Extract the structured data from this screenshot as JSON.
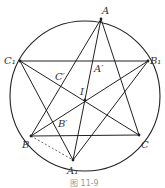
{
  "figure": {
    "caption": "图 11-9",
    "circle": {
      "cx": 85,
      "cy": 96,
      "r": 75
    },
    "points": {
      "A": {
        "label": "A",
        "x": 101,
        "y": 19,
        "lx": 102,
        "ly": 14
      },
      "B1": {
        "label": "B₁",
        "x": 148,
        "y": 61,
        "lx": 150,
        "ly": 64
      },
      "C1": {
        "label": "C₁",
        "x": 20,
        "y": 61,
        "lx": 4,
        "ly": 64
      },
      "B": {
        "label": "B",
        "x": 31,
        "y": 136,
        "lx": 22,
        "ly": 148
      },
      "C": {
        "label": "C",
        "x": 139,
        "y": 135,
        "lx": 141,
        "ly": 148
      },
      "A1": {
        "label": "A₁",
        "x": 73,
        "y": 160,
        "lx": 67,
        "ly": 174
      },
      "I": {
        "label": "I",
        "x": 85,
        "y": 100,
        "lx": 80,
        "ly": 95
      },
      "Ap": {
        "label": "A′",
        "x": 93,
        "y": 61,
        "lx": 94,
        "ly": 72
      },
      "Cp": {
        "label": "C′",
        "x": 66,
        "y": 75,
        "lx": 55,
        "ly": 80
      },
      "Bp": {
        "label": "B′",
        "x": 60,
        "y": 120,
        "lx": 58,
        "ly": 127
      }
    },
    "segments": [
      [
        "A",
        "B"
      ],
      [
        "A",
        "C"
      ],
      [
        "A",
        "A1"
      ],
      [
        "B",
        "C"
      ],
      [
        "C1",
        "B1"
      ],
      [
        "C1",
        "C"
      ],
      [
        "B1",
        "B"
      ],
      [
        "C1",
        "A1"
      ],
      [
        "B1",
        "A1"
      ]
    ],
    "dashed_segments": [
      [
        "B",
        "A1"
      ]
    ]
  }
}
